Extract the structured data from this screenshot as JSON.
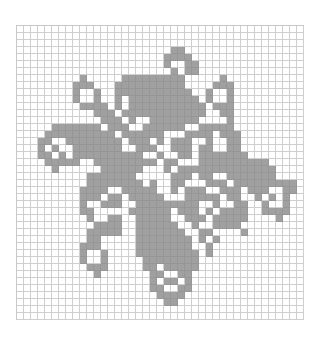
{
  "pattern": {
    "columns": 41,
    "rows": 42,
    "fill_color": "#a0a0a0",
    "grid_color": "#cfcfcf",
    "background_color": "#ffffff",
    "bitmap": [
      ".........................................",
      ".........................................",
      ".........................................",
      "......................##.................",
      ".....................####................",
      ".....................#..##...............",
      "......................#.##...............",
      ".........#.....#########.....#...........",
      "........###...##########....###..........",
      "........#..#..###########..#..#..........",
      "........#..#..#.##########.#..#..........",
      ".........####.#.###########.###..........",
      "...........###.############..##..........",
      "............###.#..#######....#..........",
      ".....#######.###..######..#####..........",
      "....##########.######...####.###.........",
      "...##..########.###.#.###..#..##.........",
      "...#.#..#######..###..###.##..##.........",
      "...##.#.##########..#..##.#######........",
      "....#####..#########.##...##########.....",
      ".....#......######...#.##############....",
      "..........#######.....###.##..#######....",
      "..........########.#..##...###.#########.",
      ".........####..#####..#.###..###.###..##.",
      ".........###.##.#####...#####.##..#.#.#..",
      ".........#..###..#########..#..##..#..#..",
      ".........##.....######.###.#.####..####..",
      "..........#..##..#####..###.#####....#...",
      "...........####..######..#..####.........",
      "..........#####..#######..##....#........",
      "..........##.....########.#.#............",
      ".........###.....########..#.............",
      ".........#..#....#########.#.............",
      ".........#..#.....########...............",
      "..........###.....##.#####...............",
      "...........#.......##..##................",
      "...................#.##.#................",
      "...................##..##................",
      "....................####.................",
      ".....................##..................",
      ".........................................",
      "........................................."
    ]
  }
}
